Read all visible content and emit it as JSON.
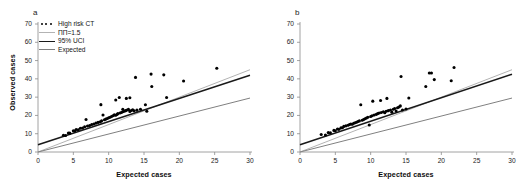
{
  "figure": {
    "background": "#ffffff",
    "panels": [
      {
        "id": "a",
        "label": "a",
        "has_legend": true
      },
      {
        "id": "b",
        "label": "b",
        "has_legend": false
      }
    ]
  },
  "legend": {
    "position": "top-left",
    "entries": [
      {
        "label": "High risk CT",
        "marker": "dots",
        "color": "#000000"
      },
      {
        "label": "ПП=1.5",
        "marker": "line",
        "color": "#b3b3b3"
      },
      {
        "label": "95% UCI",
        "marker": "line",
        "color": "#1a1a1a"
      },
      {
        "label": "Expected",
        "marker": "line",
        "color": "#808080"
      }
    ]
  },
  "chart_data": [
    {
      "type": "scatter",
      "panel": "a",
      "title": "a",
      "xlabel": "Expected cases",
      "ylabel": "Observed cases",
      "xlim": [
        0,
        30
      ],
      "ylim": [
        0,
        70
      ],
      "xticks": [
        0,
        5,
        10,
        15,
        20,
        25,
        30
      ],
      "yticks": [
        0,
        10,
        20,
        30,
        40,
        50,
        60,
        70
      ],
      "grid": false,
      "legend_position": "top-left",
      "series": [
        {
          "name": "High risk CT",
          "type": "scatter",
          "color": "#000000",
          "points": [
            [
              3.6,
              9.2
            ],
            [
              3.9,
              9.0
            ],
            [
              4.3,
              10.4
            ],
            [
              4.5,
              10.3
            ],
            [
              5.0,
              11.6
            ],
            [
              5.2,
              11.5
            ],
            [
              5.4,
              12.3
            ],
            [
              5.7,
              12.2
            ],
            [
              6.0,
              13.0
            ],
            [
              6.3,
              13.1
            ],
            [
              6.6,
              13.8
            ],
            [
              6.8,
              17.8
            ],
            [
              7.0,
              14.2
            ],
            [
              7.3,
              14.5
            ],
            [
              7.6,
              15.0
            ],
            [
              7.9,
              15.3
            ],
            [
              8.2,
              15.8
            ],
            [
              8.5,
              16.2
            ],
            [
              8.8,
              16.5
            ],
            [
              8.9,
              25.9
            ],
            [
              9.0,
              17.0
            ],
            [
              9.2,
              20.2
            ],
            [
              9.4,
              17.6
            ],
            [
              9.6,
              18.0
            ],
            [
              9.8,
              18.3
            ],
            [
              10.0,
              18.7
            ],
            [
              10.2,
              19.0
            ],
            [
              10.4,
              19.4
            ],
            [
              10.6,
              19.8
            ],
            [
              10.8,
              20.3
            ],
            [
              11.0,
              20.1
            ],
            [
              11.2,
              20.6
            ],
            [
              11.0,
              28.4
            ],
            [
              11.3,
              21.0
            ],
            [
              11.5,
              29.8
            ],
            [
              11.6,
              21.3
            ],
            [
              11.8,
              21.6
            ],
            [
              12.0,
              22.0
            ],
            [
              12.0,
              23.4
            ],
            [
              12.2,
              22.3
            ],
            [
              12.4,
              22.6
            ],
            [
              12.6,
              23.0
            ],
            [
              12.5,
              29.3
            ],
            [
              12.8,
              23.3
            ],
            [
              13.0,
              22.2
            ],
            [
              13.0,
              29.7
            ],
            [
              13.2,
              22.7
            ],
            [
              13.4,
              23.1
            ],
            [
              13.6,
              22.5
            ],
            [
              13.8,
              40.8
            ],
            [
              14.0,
              22.9
            ],
            [
              14.5,
              23.4
            ],
            [
              15.2,
              25.8
            ],
            [
              15.4,
              22.3
            ],
            [
              16.0,
              42.6
            ],
            [
              16.1,
              35.8
            ],
            [
              17.8,
              42.2
            ],
            [
              18.2,
              29.8
            ],
            [
              20.6,
              38.8
            ],
            [
              25.3,
              45.8
            ]
          ]
        },
        {
          "name": "ПП=1.5",
          "type": "line",
          "color": "#b3b3b3",
          "x": [
            0,
            30
          ],
          "y": [
            0,
            45
          ]
        },
        {
          "name": "95% UCI",
          "type": "line",
          "color": "#1a1a1a",
          "x": [
            0,
            30
          ],
          "y": [
            4.0,
            42.0
          ]
        },
        {
          "name": "Expected",
          "type": "line",
          "color": "#808080",
          "x": [
            0,
            30
          ],
          "y": [
            0,
            29.5
          ]
        }
      ]
    },
    {
      "type": "scatter",
      "panel": "b",
      "title": "b",
      "xlabel": "Expected cases",
      "ylabel": "",
      "xlim": [
        0,
        30
      ],
      "ylim": [
        0,
        70
      ],
      "xticks": [
        0,
        5,
        10,
        15,
        20,
        25,
        30
      ],
      "yticks": [
        0,
        10,
        20,
        30,
        40,
        50,
        60,
        70
      ],
      "grid": false,
      "legend_position": "none",
      "series": [
        {
          "name": "High risk CT",
          "type": "scatter",
          "color": "#000000",
          "points": [
            [
              3.0,
              9.6
            ],
            [
              3.6,
              9.3
            ],
            [
              4.0,
              10.6
            ],
            [
              4.3,
              10.5
            ],
            [
              4.8,
              11.8
            ],
            [
              5.0,
              11.6
            ],
            [
              5.3,
              12.6
            ],
            [
              5.5,
              12.4
            ],
            [
              5.8,
              13.2
            ],
            [
              6.0,
              13.3
            ],
            [
              6.2,
              14.0
            ],
            [
              6.5,
              14.3
            ],
            [
              6.8,
              14.6
            ],
            [
              7.0,
              15.0
            ],
            [
              7.2,
              15.3
            ],
            [
              7.4,
              15.2
            ],
            [
              7.6,
              15.7
            ],
            [
              7.8,
              16.0
            ],
            [
              8.0,
              16.3
            ],
            [
              8.2,
              16.7
            ],
            [
              8.4,
              17.0
            ],
            [
              8.6,
              25.8
            ],
            [
              8.8,
              17.4
            ],
            [
              9.0,
              17.8
            ],
            [
              9.2,
              18.2
            ],
            [
              9.4,
              18.6
            ],
            [
              9.6,
              19.0
            ],
            [
              9.8,
              14.8
            ],
            [
              10.0,
              19.4
            ],
            [
              10.2,
              19.8
            ],
            [
              10.3,
              27.8
            ],
            [
              10.5,
              20.2
            ],
            [
              10.8,
              20.6
            ],
            [
              11.0,
              21.0
            ],
            [
              11.2,
              21.3
            ],
            [
              11.4,
              28.2
            ],
            [
              11.5,
              21.6
            ],
            [
              11.8,
              22.0
            ],
            [
              12.0,
              21.5
            ],
            [
              12.2,
              22.3
            ],
            [
              12.3,
              29.3
            ],
            [
              12.5,
              22.6
            ],
            [
              12.8,
              23.0
            ],
            [
              13.0,
              21.8
            ],
            [
              13.2,
              23.4
            ],
            [
              13.4,
              23.8
            ],
            [
              13.6,
              22.4
            ],
            [
              13.8,
              24.2
            ],
            [
              14.0,
              24.6
            ],
            [
              14.2,
              25.2
            ],
            [
              14.3,
              41.3
            ],
            [
              14.5,
              23.0
            ],
            [
              15.0,
              23.5
            ],
            [
              15.4,
              29.5
            ],
            [
              17.8,
              35.8
            ],
            [
              18.3,
              43.2
            ],
            [
              18.6,
              43.2
            ],
            [
              19.0,
              39.6
            ],
            [
              21.4,
              39.0
            ],
            [
              21.8,
              46.2
            ]
          ]
        },
        {
          "name": "ПП=1.5",
          "type": "line",
          "color": "#b3b3b3",
          "x": [
            0,
            30
          ],
          "y": [
            0,
            45
          ]
        },
        {
          "name": "95% UCI",
          "type": "line",
          "color": "#1a1a1a",
          "x": [
            0,
            30
          ],
          "y": [
            4.0,
            42.5
          ]
        },
        {
          "name": "Expected",
          "type": "line",
          "color": "#808080",
          "x": [
            0,
            30
          ],
          "y": [
            0,
            29.5
          ]
        }
      ]
    }
  ]
}
